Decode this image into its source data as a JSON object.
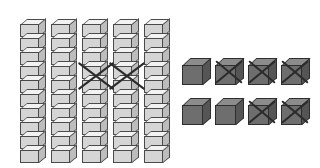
{
  "scene": {
    "title": "Base-ten blocks subtraction model",
    "background_color": "#ffffff",
    "description": "Five rods of ten and eight unit cubes, some crossed out"
  },
  "legend": {
    "rod_label": "ten-rod",
    "unit_label": "unit-cube",
    "crossed_label": "crossed-out"
  },
  "chart_data": {
    "type": "table",
    "categories": [
      "tens rods",
      "unit cubes"
    ],
    "series": [
      {
        "name": "total shown",
        "values": [
          5,
          8
        ]
      },
      {
        "name": "crossed out",
        "values": [
          2,
          5
        ]
      },
      {
        "name": "remaining",
        "values": [
          3,
          3
        ]
      }
    ],
    "values_in_units": {
      "total": 58,
      "crossed_out": 25,
      "remaining": 33
    },
    "cubes_per_rod": 10,
    "xlabel": "",
    "ylabel": "",
    "grid": false,
    "legend_position": "none"
  },
  "rods": {
    "cubes_per_rod": 10,
    "fill_color": "#d5d5d5",
    "top_color": "#f2f2f2",
    "side_color": "#bdbdbd",
    "edge_color": "#4a4a4a",
    "items": [
      {
        "index": 1,
        "label": "ten-rod-1",
        "left": 20,
        "top": 12,
        "crossed": false
      },
      {
        "index": 2,
        "label": "ten-rod-2",
        "left": 51,
        "top": 12,
        "crossed": false
      },
      {
        "index": 3,
        "label": "ten-rod-3",
        "left": 82,
        "top": 12,
        "crossed": true
      },
      {
        "index": 4,
        "label": "ten-rod-4",
        "left": 113,
        "top": 12,
        "crossed": true
      },
      {
        "index": 5,
        "label": "ten-rod-5",
        "left": 144,
        "top": 12,
        "crossed": false
      }
    ]
  },
  "units": {
    "fill_color": "#6e6e6e",
    "top_color": "#8c8c8c",
    "side_color": "#555555",
    "edge_color": "#2e2e2e",
    "cross_color": "#2b2b2b",
    "items": [
      {
        "index": 1,
        "label": "unit-cube-1",
        "row": 1,
        "left": 182,
        "top": 58,
        "crossed": false
      },
      {
        "index": 2,
        "label": "unit-cube-2",
        "row": 1,
        "left": 215,
        "top": 58,
        "crossed": true
      },
      {
        "index": 3,
        "label": "unit-cube-3",
        "row": 1,
        "left": 248,
        "top": 58,
        "crossed": true
      },
      {
        "index": 4,
        "label": "unit-cube-4",
        "row": 1,
        "left": 281,
        "top": 58,
        "crossed": true
      },
      {
        "index": 5,
        "label": "unit-cube-5",
        "row": 2,
        "left": 182,
        "top": 98,
        "crossed": false
      },
      {
        "index": 6,
        "label": "unit-cube-6",
        "row": 2,
        "left": 215,
        "top": 98,
        "crossed": false
      },
      {
        "index": 7,
        "label": "unit-cube-7",
        "row": 2,
        "left": 248,
        "top": 98,
        "crossed": true
      },
      {
        "index": 8,
        "label": "unit-cube-8",
        "row": 2,
        "left": 281,
        "top": 98,
        "crossed": true
      }
    ]
  },
  "rod_crosses": [
    {
      "label": "rod-cross-1",
      "left": 74,
      "top": 58
    },
    {
      "label": "rod-cross-2",
      "left": 105,
      "top": 58
    }
  ]
}
